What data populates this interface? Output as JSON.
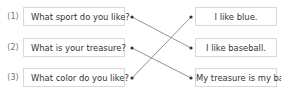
{
  "exercise": {
    "questions": [
      {
        "number": "(1)",
        "text": "What sport do you like?"
      },
      {
        "number": "(2)",
        "text": "What is your treasure?"
      },
      {
        "number": "(3)",
        "text": "What color do you like?"
      }
    ],
    "answers": [
      {
        "text": "I like blue."
      },
      {
        "text": "I like baseball."
      },
      {
        "text": "My treasure is my bag."
      }
    ],
    "connections": [
      {
        "question": 1,
        "answer": 2
      },
      {
        "question": 2,
        "answer": 3
      },
      {
        "question": 3,
        "answer": 1
      }
    ],
    "colors": {
      "line": "#777777",
      "dot": "#333333",
      "border": "#d8d8d8"
    }
  }
}
